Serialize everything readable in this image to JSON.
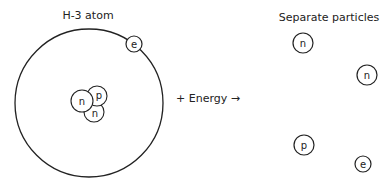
{
  "atom": {
    "title": "H-3 atom",
    "electron": "e",
    "nucleus": [
      "n",
      "p",
      "n"
    ]
  },
  "reaction": {
    "label": "+ Energy →"
  },
  "products": {
    "title": "Separate particles",
    "particles": [
      "n",
      "n",
      "p",
      "e"
    ]
  },
  "colors": {
    "stroke": "#222222",
    "background": "#ffffff"
  }
}
